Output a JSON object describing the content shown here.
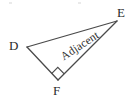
{
  "figure": {
    "type": "right-triangle-geometry-diagram",
    "background_color": "#ffffff",
    "stroke_color": "#4a4a4a",
    "text_color": "#2b2b2b",
    "vertices": [
      {
        "id": "D",
        "label": "D",
        "x": 27,
        "y": 47
      },
      {
        "id": "E",
        "label": "E",
        "x": 117,
        "y": 21
      },
      {
        "id": "F",
        "label": "F",
        "x": 58,
        "y": 80
      }
    ],
    "sides": [
      {
        "from": "D",
        "to": "E",
        "label": ""
      },
      {
        "from": "D",
        "to": "F",
        "label": ""
      },
      {
        "from": "F",
        "to": "E",
        "label": "Adjacent"
      }
    ],
    "right_angle": {
      "at_vertex": "F",
      "marker": "square",
      "marker_size": 9
    },
    "labels": {
      "d": "D",
      "e": "E",
      "f": "F",
      "adjacent": "Adjacent"
    }
  }
}
